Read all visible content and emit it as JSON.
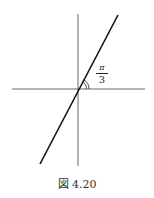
{
  "figure": {
    "caption": "図 4.20",
    "angle_label": {
      "numerator": "π",
      "denominator": "3"
    },
    "axes": {
      "horizontal": {
        "x1": 12,
        "y1": 89,
        "x2": 145,
        "y2": 89
      },
      "vertical": {
        "x1": 78,
        "y1": 14,
        "x2": 78,
        "y2": 166
      }
    },
    "line": {
      "x1": 40,
      "y1": 164,
      "x2": 118,
      "y2": 15,
      "angle": "π/3"
    },
    "colors": {
      "axis": "#555555",
      "line": "#111111",
      "text": "#222222"
    }
  }
}
